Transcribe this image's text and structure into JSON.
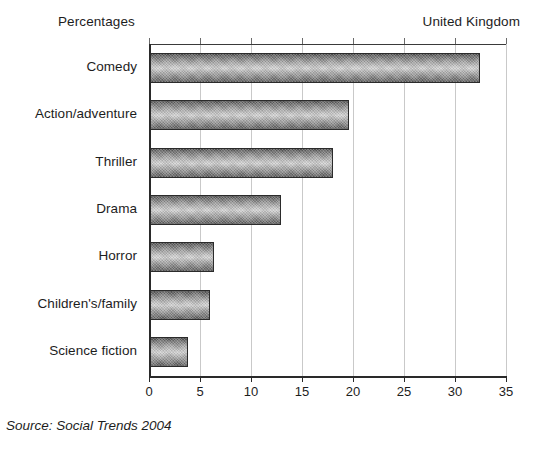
{
  "header": {
    "units_label": "Percentages",
    "region_label": "United Kingdom"
  },
  "source": {
    "note": "Source: Social Trends 2004"
  },
  "chart_data": {
    "type": "bar",
    "orientation": "horizontal",
    "title": "",
    "subtitle": "",
    "xlabel": "Percentages",
    "ylabel": "",
    "categories": [
      "Comedy",
      "Action/adventure",
      "Thriller",
      "Drama",
      "Horror",
      "Children's/family",
      "Science fiction"
    ],
    "values": [
      32.4,
      19.5,
      17.9,
      12.8,
      6.3,
      5.9,
      3.7
    ],
    "xlim": [
      0,
      35
    ],
    "xticks": [
      0,
      5,
      10,
      15,
      20,
      25,
      30,
      35
    ],
    "xtick_labels": [
      "0",
      "5",
      "10",
      "15",
      "20",
      "25",
      "30",
      "35"
    ],
    "grid": "vertical",
    "legend": "none",
    "bar_style": "3d-cylinder-gradient-hatched",
    "bar_edge_color": "#2b2b2b",
    "gridline_color": "#c9c9c9",
    "axis_color": "#2a2a2a"
  }
}
